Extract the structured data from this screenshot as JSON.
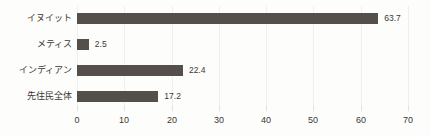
{
  "chart_data": {
    "type": "bar",
    "orientation": "horizontal",
    "title": "",
    "subtitle": "",
    "xlabel": "",
    "ylabel": "",
    "categories": [
      "イヌイット",
      "メティス",
      "インディアン",
      "先住民全体"
    ],
    "values": [
      63.7,
      2.5,
      22.4,
      17.2
    ],
    "value_labels": [
      "63.7",
      "2.5",
      "22.4",
      "17.2"
    ],
    "xlim": [
      0,
      70
    ],
    "xticks": [
      0,
      10,
      20,
      30,
      40,
      50,
      60,
      70
    ],
    "xtick_labels": [
      "0",
      "10",
      "20",
      "30",
      "40",
      "50",
      "60",
      "70"
    ],
    "grid": true,
    "legend": false,
    "bar_color": "#544f4a",
    "grid_color": "#f0efeb",
    "text_color": "#3b3733",
    "background_color": "#fdfdfb"
  }
}
